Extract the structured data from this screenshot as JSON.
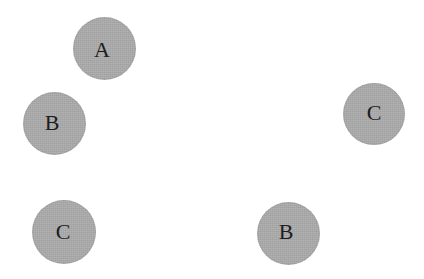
{
  "canvas": {
    "width": 424,
    "height": 279,
    "background_color": "#ffffff"
  },
  "style": {
    "node_fill_color": "#ababab",
    "node_label_color": "#1d1d1d",
    "node_label_font_size": 22
  },
  "diagram": {
    "type": "labeled-circles",
    "node_count": 5,
    "nodes": [
      {
        "id": "node-a-top",
        "label": "A",
        "cx": 104,
        "cy": 48,
        "diameter": 63,
        "label_dx": -2,
        "label_dy": 2
      },
      {
        "id": "node-b-left",
        "label": "B",
        "cx": 54,
        "cy": 123,
        "diameter": 63,
        "label_dx": -2,
        "label_dy": 0
      },
      {
        "id": "node-c-right",
        "label": "C",
        "cx": 374,
        "cy": 114,
        "diameter": 62,
        "label_dx": 0,
        "label_dy": -1
      },
      {
        "id": "node-c-bottom-left",
        "label": "C",
        "cx": 64,
        "cy": 232,
        "diameter": 64,
        "label_dx": -1,
        "label_dy": 0
      },
      {
        "id": "node-b-bottom",
        "label": "B",
        "cx": 288,
        "cy": 233,
        "diameter": 63,
        "label_dx": -2,
        "label_dy": -1
      }
    ]
  }
}
